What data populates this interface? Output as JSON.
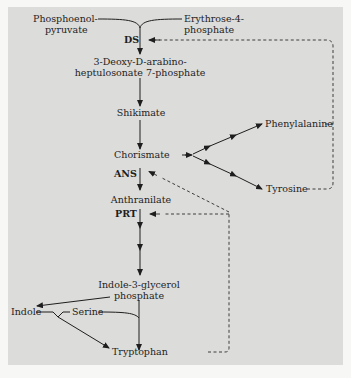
{
  "diagram": {
    "nodes": {
      "pep_line1": "Phosphoenol-",
      "pep_line2": "pyruvate",
      "e4p_line1": "Erythrose-4-",
      "e4p_line2": "phosphate",
      "ds": "DS",
      "dahp_line1": "3-Deoxy-D-arabino-",
      "dahp_line2": "heptulosonate 7-phosphate",
      "shikimate": "Shikimate",
      "chorismate": "Chorismate",
      "phenylalanine": "Phenylalanine",
      "tyrosine": "Tyrosine",
      "ans": "ANS",
      "anthranilate": "Anthranilate",
      "prt": "PRT",
      "igp_line1": "Indole-3-glycerol",
      "igp_line2": "phosphate",
      "indole": "Indole",
      "serine": "Serine",
      "tryptophan": "Tryptophan"
    },
    "edges": [
      {
        "from": "Phosphoenolpyruvate + Erythrose-4-phosphate",
        "to": "3-Deoxy-D-arabino-heptulosonate 7-phosphate",
        "enzyme": "DS",
        "type": "solid"
      },
      {
        "from": "3-Deoxy-D-arabino-heptulosonate 7-phosphate",
        "to": "Shikimate",
        "type": "solid"
      },
      {
        "from": "Shikimate",
        "to": "Chorismate",
        "type": "solid"
      },
      {
        "from": "Chorismate",
        "to": "Phenylalanine",
        "type": "solid-multistep"
      },
      {
        "from": "Chorismate",
        "to": "Tyrosine",
        "type": "solid-multistep"
      },
      {
        "from": "Chorismate",
        "to": "Anthranilate",
        "enzyme": "ANS",
        "type": "solid"
      },
      {
        "from": "Anthranilate",
        "to": "Indole-3-glycerol phosphate",
        "enzyme": "PRT",
        "type": "solid-multistep"
      },
      {
        "from": "Indole-3-glycerol phosphate",
        "to": "Indole",
        "type": "solid"
      },
      {
        "from": "Indole-3-glycerol phosphate + Serine",
        "to": "Tryptophan",
        "type": "solid"
      },
      {
        "from": "Indole + Serine",
        "to": "Tryptophan",
        "type": "solid"
      },
      {
        "from": "Phenylalanine",
        "to": "DS",
        "type": "dashed-feedback"
      },
      {
        "from": "Tyrosine",
        "to": "DS",
        "type": "dashed-feedback"
      },
      {
        "from": "Tryptophan",
        "to": "ANS",
        "type": "dashed-feedback"
      },
      {
        "from": "Tryptophan",
        "to": "PRT",
        "type": "dashed-feedback"
      }
    ],
    "colors": {
      "page_bg": "#f7f7f5",
      "panel_bg": "#dcdcda",
      "ink": "#1e1e1e"
    }
  }
}
